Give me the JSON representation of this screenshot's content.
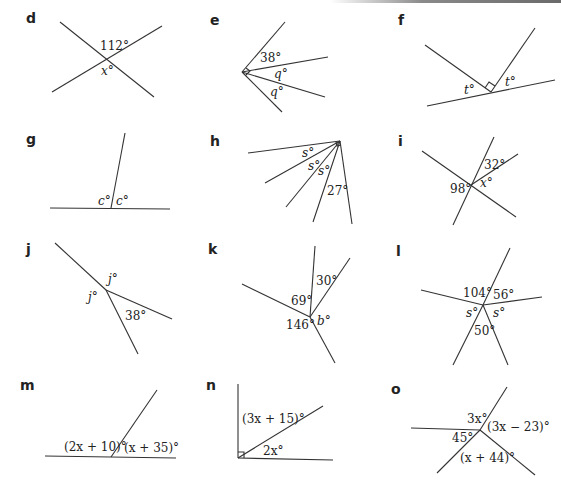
{
  "panels": {
    "d": {
      "label": "d",
      "angles": [
        "112°",
        "x°"
      ]
    },
    "e": {
      "label": "e",
      "angles": [
        "38°",
        "q°",
        "q°"
      ]
    },
    "f": {
      "label": "f",
      "angles": [
        "t°",
        "t°"
      ]
    },
    "g": {
      "label": "g",
      "angles": [
        "c°",
        "c°"
      ]
    },
    "h": {
      "label": "h",
      "angles": [
        "s°",
        "s°",
        "s°",
        "27°"
      ]
    },
    "i": {
      "label": "i",
      "angles": [
        "32°",
        "98°",
        "x°"
      ]
    },
    "j": {
      "label": "j",
      "angles": [
        "j°",
        "j°",
        "38°"
      ]
    },
    "k": {
      "label": "k",
      "angles": [
        "30°",
        "69°",
        "146°",
        "b°"
      ]
    },
    "l": {
      "label": "l",
      "angles": [
        "104°",
        "56°",
        "s°",
        "s°",
        "50°"
      ]
    },
    "m": {
      "label": "m",
      "angles": [
        "(2x + 10)°",
        "(x + 35)°"
      ]
    },
    "n": {
      "label": "n",
      "angles": [
        "(3x + 15)°",
        "2x°"
      ]
    },
    "o": {
      "label": "o",
      "angles": [
        "3x°",
        "(3x − 23)°",
        "45°",
        "(x + 44)°"
      ]
    }
  }
}
